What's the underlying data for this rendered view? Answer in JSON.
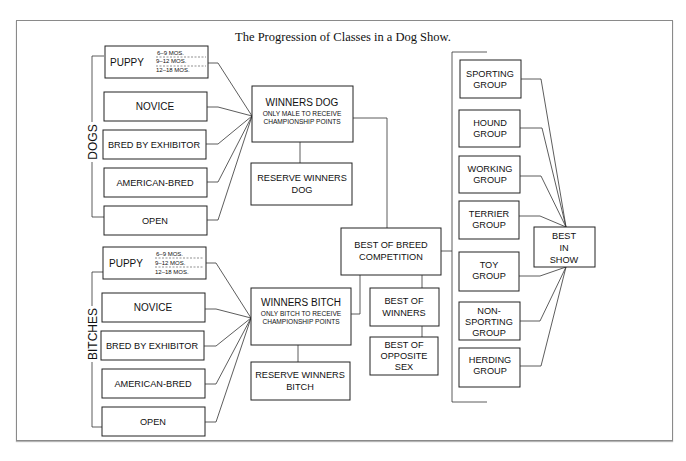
{
  "title": "The Progression of Classes in a Dog Show.",
  "groups": {
    "dogs_label": "DOGS",
    "bitches_label": "BITCHES"
  },
  "dogs_classes": {
    "puppy": "PUPPY",
    "puppy_ages": [
      "6–9 MOS.",
      "9–12 MOS.",
      "12–18 MOS."
    ],
    "novice": "NOVICE",
    "bred_by_exhibitor": "BRED BY EXHIBITOR",
    "american_bred": "AMERICAN-BRED",
    "open": "OPEN"
  },
  "bitches_classes": {
    "puppy": "PUPPY",
    "puppy_ages": [
      "6–9 MOS.",
      "9–12 MOS.",
      "12–18 MOS."
    ],
    "novice": "NOVICE",
    "bred_by_exhibitor": "BRED BY EXHIBITOR",
    "american_bred": "AMERICAN-BRED",
    "open": "OPEN"
  },
  "winners_dog": {
    "title": "WINNERS DOG",
    "note_line1": "ONLY MALE TO RECEIVE",
    "note_line2": "CHAMPIONSHIP POINTS"
  },
  "reserve_winners_dog": {
    "line1": "RESERVE WINNERS",
    "line2": "DOG"
  },
  "winners_bitch": {
    "title": "WINNERS BITCH",
    "note_line1": "ONLY BITCH TO RECEIVE",
    "note_line2": "CHAMPIONSHIP POINTS"
  },
  "reserve_winners_bitch": {
    "line1": "RESERVE WINNERS",
    "line2": "BITCH"
  },
  "best_of_breed": {
    "line1": "BEST OF BREED",
    "line2": "COMPETITION"
  },
  "best_of_winners": {
    "line1": "BEST OF",
    "line2": "WINNERS"
  },
  "best_of_opposite_sex": {
    "line1": "BEST OF",
    "line2": "OPPOSITE",
    "line3": "SEX"
  },
  "show_groups": [
    {
      "line1": "SPORTING",
      "line2": "GROUP"
    },
    {
      "line1": "HOUND",
      "line2": "GROUP"
    },
    {
      "line1": "WORKING",
      "line2": "GROUP"
    },
    {
      "line1": "TERRIER",
      "line2": "GROUP"
    },
    {
      "line1": "TOY",
      "line2": "GROUP"
    },
    {
      "line1": "NON-",
      "line2": "SPORTING",
      "line3": "GROUP"
    },
    {
      "line1": "HERDING",
      "line2": "GROUP"
    }
  ],
  "best_in_show": {
    "line1": "BEST",
    "line2": "IN",
    "line3": "SHOW"
  }
}
